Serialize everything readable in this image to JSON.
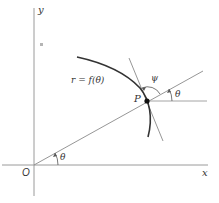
{
  "diagram": {
    "labels": {
      "y_axis": "y",
      "x_axis": "x",
      "origin": "O",
      "point": "P",
      "curve": "r = f(θ)",
      "theta_origin": "θ",
      "theta_point": "θ",
      "psi": "ψ"
    },
    "colors": {
      "axis": "#9a9a9a",
      "line": "#8a8a8a",
      "curve": "#333333",
      "point": "#111111",
      "text": "#333333"
    }
  }
}
